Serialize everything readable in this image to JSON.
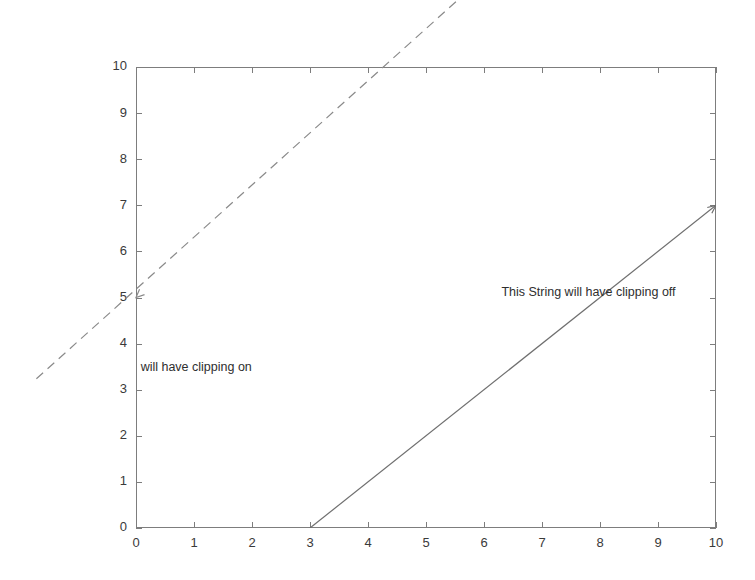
{
  "figure": {
    "width": 755,
    "height": 580,
    "background_color": "#ffffff"
  },
  "chart_data": {
    "type": "line",
    "title": "",
    "subtitle": "",
    "xlabel": "",
    "ylabel": "",
    "xlim": [
      0,
      10
    ],
    "ylim": [
      0,
      10
    ],
    "grid": false,
    "legend": null,
    "legend_position": "none",
    "x_ticks": [
      0,
      1,
      2,
      3,
      4,
      5,
      6,
      7,
      8,
      9,
      10
    ],
    "y_ticks": [
      0,
      1,
      2,
      3,
      4,
      5,
      6,
      7,
      8,
      9,
      10
    ],
    "x_tick_labels": [
      "0",
      "1",
      "2",
      "3",
      "4",
      "5",
      "6",
      "7",
      "8",
      "9",
      "10"
    ],
    "y_tick_labels": [
      "0",
      "1",
      "2",
      "3",
      "4",
      "5",
      "6",
      "7",
      "8",
      "9",
      "10"
    ],
    "series": [
      {
        "name": "clipping-on-arrow",
        "style": "solid",
        "color": "#6f6f6f",
        "clipping": "on",
        "arrow_at": "end",
        "x": [
          3,
          10
        ],
        "y": [
          0,
          7
        ]
      },
      {
        "name": "clipping-off-arrow",
        "style": "dashed",
        "color": "#8a8a8a",
        "clipping": "off",
        "arrow_at": "start",
        "x": [
          5.9,
          -1.75
        ],
        "y": [
          11.85,
          3.2
        ],
        "arrow_tip_x": 0,
        "arrow_tip_y": 5
      }
    ],
    "annotations": [
      {
        "name": "clipping-on-label",
        "text": "will have clipping on",
        "x": 0.08,
        "y": 3.48,
        "color": "#2e2e2e",
        "clipping": "on"
      },
      {
        "name": "clipping-off-label",
        "text": "This String will have clipping off",
        "x": 6.3,
        "y": 5.1,
        "color": "#2e2e2e",
        "clipping": "off"
      }
    ],
    "axes_color": "#7d7d7d",
    "tick_label_color": "#3a3a3a"
  },
  "geometry": {
    "plot_left": 136,
    "plot_right": 716,
    "plot_top": 67,
    "plot_bottom": 528,
    "tick_length": 6
  }
}
